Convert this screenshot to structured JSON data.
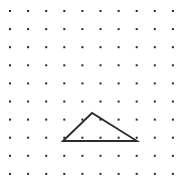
{
  "canvas": {
    "width": 188,
    "height": 190,
    "background_color": "#ffffff",
    "title": "Dot grid with triangle"
  },
  "grid": {
    "name": "dot-grid",
    "rows": 10,
    "cols": 10,
    "origin_x": 10,
    "origin_y": 11,
    "spacing_x": 18.1,
    "spacing_y": 18.1,
    "dot_size": 2,
    "dot_color": "#262626",
    "dot_shape": "square"
  },
  "shape": {
    "name": "triangle",
    "type": "polygon",
    "stroke_color": "#2b2b2b",
    "stroke_width": 1.8,
    "fill": "none",
    "vertices": [
      {
        "label": "left-base-vertex",
        "x": 63,
        "y": 141,
        "grid_col": 3,
        "grid_row": 7
      },
      {
        "label": "apex-vertex",
        "x": 92,
        "y": 113,
        "grid_col": 4.5,
        "grid_row": 5.6
      },
      {
        "label": "right-base-vertex",
        "x": 137,
        "y": 141,
        "grid_col": 7,
        "grid_row": 7
      }
    ],
    "points_attr": "63,141 92,113 137,141 63,141"
  },
  "chart_data": {
    "type": "scatter",
    "xlabel": "",
    "ylabel": "",
    "xlim": [
      0,
      188
    ],
    "ylim": [
      0,
      190
    ],
    "grid": true,
    "legend": "none",
    "annotations": [
      "Triangle drawn over a 10 x 10 array of evenly spaced dots",
      "Base of triangle lies along a row of dots",
      "Apex sits between dot rows, above the base"
    ]
  }
}
